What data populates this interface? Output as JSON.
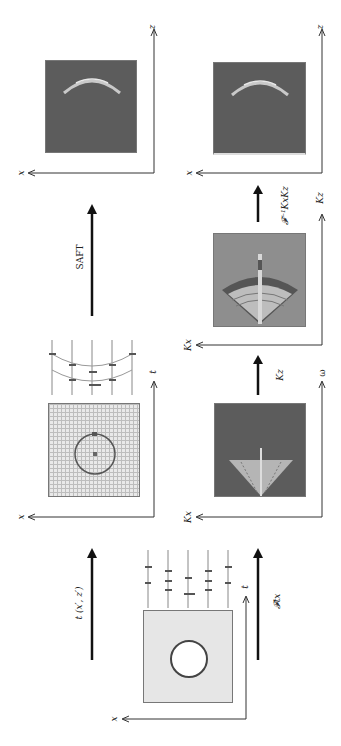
{
  "diagram": {
    "panels": [
      {
        "id": "phantom",
        "description": "Object with circular inclusion",
        "axes": {
          "horizontal": "x",
          "vertical": "t"
        }
      },
      {
        "id": "measured_traces",
        "description": "A-scan traces with hyperbolic echoes over sampling grid",
        "axes": {
          "horizontal": "x",
          "vertical": "t"
        }
      },
      {
        "id": "saft_image",
        "description": "SAFT reconstructed image (arc)",
        "axes": {
          "horizontal": "x",
          "vertical": "z"
        }
      },
      {
        "id": "fk_spectrum",
        "description": "2D spectrum in Kx-omega domain",
        "axes": {
          "horizontal": "Kx",
          "vertical": "ω"
        }
      },
      {
        "id": "kz_spectrum",
        "description": "Remapped spectrum in Kx-Kz domain",
        "axes": {
          "horizontal": "Kx",
          "vertical": "Kz"
        }
      },
      {
        "id": "fk_image",
        "description": "Inverse transformed image (arc)",
        "axes": {
          "horizontal": "x",
          "vertical": "z"
        }
      }
    ],
    "arrows": [
      {
        "id": "arrow-time-of-flight",
        "label": "t (x′, z′)"
      },
      {
        "id": "arrow-saft",
        "label": "SAFT"
      },
      {
        "id": "arrow-fourier-tx",
        "label": "𝓕tx"
      },
      {
        "id": "arrow-kz",
        "label": "Kz"
      },
      {
        "id": "arrow-inverse-fourier",
        "label": "𝓕⁻¹KxKz"
      }
    ],
    "axis_labels": {
      "x": "x",
      "z": "z",
      "t": "t",
      "kx": "Kx",
      "kz": "Kz",
      "omega": "ω"
    }
  }
}
